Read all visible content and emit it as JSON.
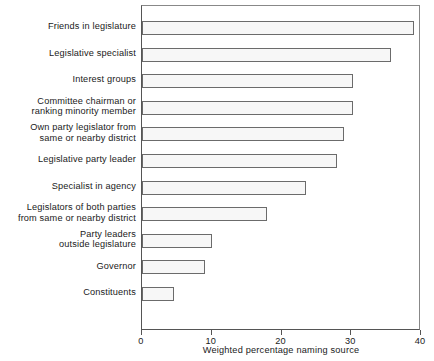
{
  "chart_data": {
    "type": "bar",
    "orientation": "horizontal",
    "title": "",
    "xlabel": "Weighted percentage naming source",
    "ylabel": "",
    "xlim": [
      0,
      40
    ],
    "xticks": [
      0,
      10,
      20,
      30,
      40
    ],
    "xtick_labels": [
      "0",
      "10",
      "20",
      "30",
      "40"
    ],
    "grid": false,
    "legend": false,
    "categories": [
      "Friends in legislature",
      "Legislative specialist",
      "Interest groups",
      "Committee chairman or\nranking minority member",
      "Own party legislator from\nsame or nearby district",
      "Legislative party leader",
      "Specialist in agency",
      "Legislators of both parties\nfrom same or nearby district",
      "Party leaders\noutside legislature",
      "Governor",
      "Constituents"
    ],
    "values": [
      39,
      35.7,
      30.2,
      30.2,
      29,
      28,
      23.5,
      17.9,
      10,
      9,
      4.6
    ],
    "bar_fill_color": "#f7f7f7",
    "bar_edge_color": "#6b6b6b",
    "axis_color": "#555555",
    "text_color": "#1a1a1a"
  }
}
